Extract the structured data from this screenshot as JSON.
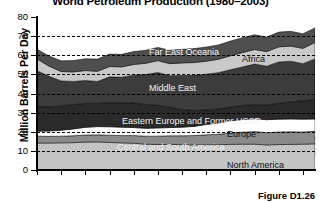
{
  "chart_data": {
    "type": "area",
    "title": "World Petroleum Production (1980–2003)",
    "xlabel": "",
    "ylabel": "Million Barrels Per Day",
    "ylim": [
      0,
      80
    ],
    "yticks": [
      0,
      10,
      20,
      30,
      40,
      50,
      60,
      70,
      80
    ],
    "xlim": [
      1980,
      2003
    ],
    "xticks": [
      1980,
      1982,
      1984,
      1986,
      1988,
      1990,
      1992,
      1994,
      1996,
      1998,
      2000,
      2002
    ],
    "xtick_labels": [
      "1980",
      "1982",
      "1984",
      "1986",
      "1988",
      "1990",
      "1992",
      "1994",
      "1996",
      "1998",
      "2000",
      "2002"
    ],
    "grid": "horizontal-dashed",
    "legend": "inline-band-labels",
    "stacked": true,
    "x": [
      1980,
      1981,
      1982,
      1983,
      1984,
      1985,
      1986,
      1987,
      1988,
      1989,
      1990,
      1991,
      1992,
      1993,
      1994,
      1995,
      1996,
      1997,
      1998,
      1999,
      2000,
      2001,
      2002,
      2003
    ],
    "series": [
      {
        "name": "North America",
        "color": "#c4c4c4",
        "values": [
          14.1,
          14.1,
          14.2,
          14.3,
          14.6,
          14.7,
          14.4,
          14.2,
          14.0,
          13.5,
          13.3,
          13.4,
          13.2,
          13.1,
          13.2,
          13.2,
          13.4,
          13.5,
          13.5,
          13.1,
          13.3,
          13.4,
          13.5,
          13.7
        ]
      },
      {
        "name": "Central and South America",
        "color": "#8a8a8a",
        "values": [
          3.6,
          3.5,
          3.5,
          3.6,
          3.7,
          3.7,
          3.8,
          3.8,
          4.0,
          4.2,
          4.4,
          4.5,
          4.7,
          4.9,
          5.2,
          5.5,
          5.9,
          6.3,
          6.6,
          6.4,
          6.6,
          6.6,
          6.4,
          6.5
        ]
      },
      {
        "name": "Europe",
        "color": "#ffffff",
        "values": [
          2.6,
          2.8,
          3.1,
          3.6,
          4.0,
          4.3,
          4.4,
          4.4,
          4.2,
          4.1,
          4.3,
          4.3,
          4.5,
          4.8,
          5.4,
          5.9,
          6.4,
          6.6,
          6.7,
          6.8,
          6.7,
          6.7,
          6.7,
          6.5
        ]
      },
      {
        "name": "Eastern Europe and Former USSR",
        "color": "#2a2a2a",
        "values": [
          12.7,
          12.6,
          12.7,
          12.7,
          12.5,
          12.1,
          12.6,
          12.8,
          12.8,
          12.5,
          11.8,
          10.6,
          9.2,
          8.3,
          7.6,
          7.3,
          7.2,
          7.3,
          7.4,
          7.7,
          8.3,
          8.9,
          9.6,
          10.3
        ]
      },
      {
        "name": "Middle East",
        "color": "#3c3c3c",
        "values": [
          18.9,
          16.0,
          13.1,
          12.1,
          12.0,
          11.5,
          13.5,
          13.3,
          14.6,
          15.6,
          17.2,
          16.5,
          17.8,
          18.4,
          18.7,
          19.0,
          19.5,
          20.2,
          21.2,
          20.3,
          21.6,
          21.3,
          19.4,
          21.1
        ]
      },
      {
        "name": "Africa",
        "color": "#c9c9c9",
        "values": [
          6.2,
          5.3,
          4.9,
          5.0,
          5.2,
          5.3,
          5.4,
          5.4,
          5.6,
          5.9,
          6.2,
          6.3,
          6.6,
          6.7,
          6.8,
          7.0,
          7.3,
          7.5,
          7.6,
          7.6,
          7.9,
          7.9,
          8.0,
          8.6
        ]
      },
      {
        "name": "Far East Oceania",
        "color": "#4f4f4f",
        "values": [
          5.1,
          5.3,
          5.6,
          5.9,
          6.2,
          6.4,
          6.5,
          6.6,
          6.7,
          6.8,
          6.9,
          7.0,
          7.1,
          7.3,
          7.4,
          7.5,
          7.7,
          7.8,
          7.7,
          7.6,
          7.7,
          7.7,
          7.6,
          7.6
        ]
      }
    ],
    "totals": [
      63.2,
      59.6,
      57.1,
      57.2,
      58.2,
      58.0,
      60.6,
      60.5,
      61.9,
      62.6,
      64.1,
      62.6,
      63.1,
      63.5,
      64.3,
      65.4,
      67.4,
      69.2,
      70.7,
      69.5,
      72.1,
      72.5,
      71.2,
      74.3
    ]
  },
  "band_labels": [
    {
      "text": "Far East Oceania",
      "tone": "light-on-dark"
    },
    {
      "text": "Africa",
      "tone": "dark-on-light"
    },
    {
      "text": "Middle East",
      "tone": "light-on-dark"
    },
    {
      "text": "Eastern Europe and Former USSR",
      "tone": "light-on-dark"
    },
    {
      "text": "Europe",
      "tone": "dark-on-light"
    },
    {
      "text": "Central and South America",
      "tone": "light-on-dark"
    },
    {
      "text": "North America",
      "tone": "dark-on-light"
    }
  ],
  "caption": {
    "text": "Figure D1.26"
  }
}
